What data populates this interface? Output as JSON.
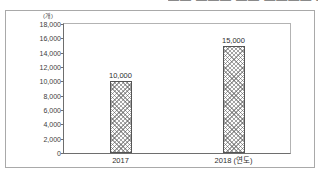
{
  "figure": {
    "top_cut_text": "▬▬ ▬▬▬ ▬▬ ▬▬▬▬ ▬▬",
    "frame_color": "#a9a9a9",
    "background_color": "#ffffff"
  },
  "chart_data": {
    "type": "bar",
    "title": "",
    "subtitle": "",
    "xlabel": "(연도)",
    "ylabel": "(개)",
    "categories": [
      "2017",
      "2018 (연도)"
    ],
    "values": [
      10000,
      15000
    ],
    "value_labels": [
      "10,000",
      "15,000"
    ],
    "ylim": [
      0,
      18000
    ],
    "ytick_values": [
      0,
      2000,
      4000,
      6000,
      8000,
      10000,
      12000,
      14000,
      16000,
      18000
    ],
    "ytick_labels": [
      "0",
      "2,000",
      "4,000",
      "6,000",
      "8,000",
      "10,000",
      "12,000",
      "14,000",
      "16,000",
      "18,000"
    ],
    "grid": false,
    "legend": "none",
    "bar_fill": "diagonal-crosshatch",
    "bar_border_color": "#555555",
    "axis_color": "#6e6e6e",
    "text_color": "#2e2e2e"
  }
}
